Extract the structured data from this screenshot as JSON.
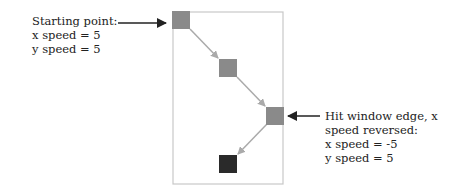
{
  "diagram": {
    "start_label": {
      "line1": "Starting point:",
      "line2": "x speed = 5",
      "line3": "y speed = 5"
    },
    "edge_label": {
      "line1": "Hit window edge, x",
      "line2": "speed reversed:",
      "line3": "x speed = -5",
      "line4": "y speed = 5"
    },
    "colors": {
      "window_border": "#c8c8c8",
      "square": "#8a8a8a",
      "final_square": "#2a2a2a",
      "path_arrow": "#aaaaaa",
      "pointer_arrow": "#222222"
    }
  }
}
